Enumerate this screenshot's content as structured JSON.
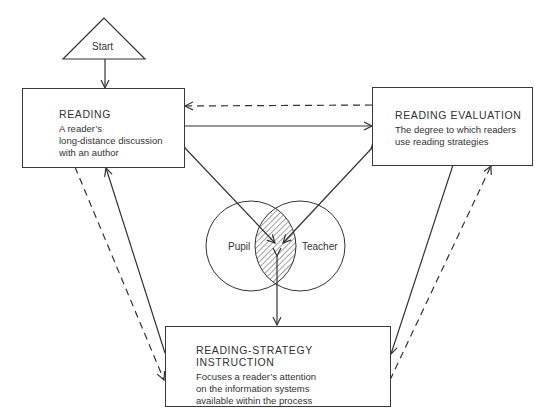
{
  "start": {
    "label": "Start"
  },
  "reading": {
    "title": "READING",
    "lines": [
      "A reader’s",
      "long-distance discussion",
      "with an author"
    ]
  },
  "evaluation": {
    "title": "READING EVALUATION",
    "lines": [
      "The degree to which readers",
      "use reading strategies"
    ]
  },
  "instruction": {
    "title": "READING-STRATEGY INSTRUCTION",
    "lines": [
      "Focuses a reader’s attention",
      "on the information systems",
      "available within the process"
    ]
  },
  "venn": {
    "left": "Pupil",
    "right": "Teacher"
  }
}
